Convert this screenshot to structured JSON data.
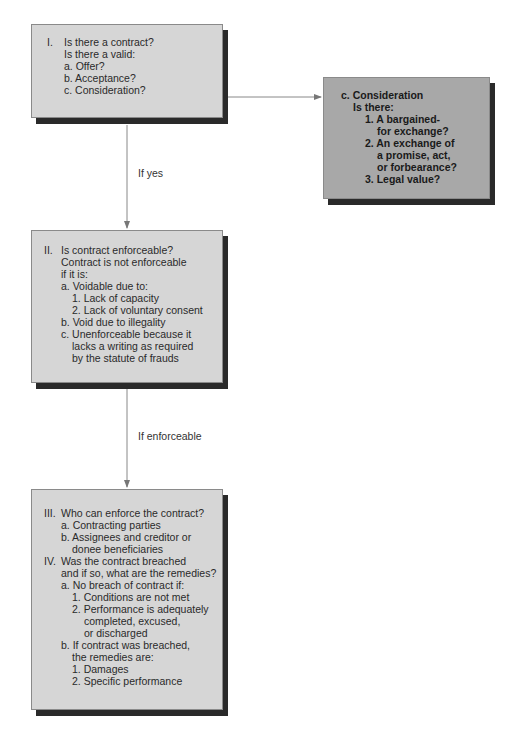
{
  "diagram": {
    "box_1": {
      "lines": [
        "I.",
        "Is there a contract?",
        "Is there a valid:",
        "a. Offer?",
        "b. Acceptance?",
        "c. Consideration?"
      ]
    },
    "box_consideration": {
      "lines": [
        "c. Consideration",
        "Is there:",
        "1. A bargained-",
        "for exchange?",
        "2. An exchange of",
        "a promise, act,",
        "or forbearance?",
        "3. Legal value?"
      ]
    },
    "box_2": {
      "lines": [
        "II.",
        "Is contract enforceable?",
        "Contract is not enforceable",
        "if it is:",
        "a. Voidable due to:",
        "1. Lack of capacity",
        "2. Lack of voluntary consent",
        "b. Void due to illegality",
        "c. Unenforceable because it",
        "lacks a writing as required",
        "by the statute of frauds"
      ]
    },
    "box_3": {
      "lines": [
        "III.",
        "Who can enforce the contract?",
        "a. Contracting parties",
        "b. Assignees and creditor or",
        "donee beneficiaries",
        "IV.",
        "Was the contract breached",
        "and if so, what are the remedies?",
        "a. No breach of contract if:",
        "1. Conditions are not met",
        "2. Performance is adequately",
        "completed, excused,",
        "or discharged",
        "b. If contract was breached,",
        "the remedies are:",
        "1. Damages",
        "2. Specific performance"
      ]
    },
    "edges": {
      "if_yes": "If yes",
      "if_enforceable": "If enforceable"
    },
    "colors": {
      "box_fill": "#d6d6d6",
      "box_fill_dark": "#a8a8a8",
      "shadow": "#2a2a2a",
      "connector": "#777777"
    }
  }
}
